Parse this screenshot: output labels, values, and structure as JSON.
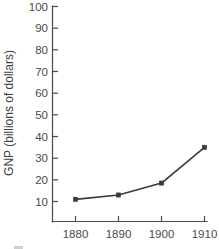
{
  "chart_data": {
    "type": "line",
    "title": "",
    "subtitle": "",
    "xlabel": "",
    "ylabel": "GNP (billions of dollars)",
    "x": [
      1880,
      1890,
      1900,
      1910
    ],
    "categories": [
      "1880",
      "1890",
      "1900",
      "1910"
    ],
    "values": [
      11,
      13,
      18.5,
      35
    ],
    "series": [
      {
        "name": "GNP",
        "values": [
          11,
          13,
          18.5,
          35
        ]
      }
    ],
    "xlim": [
      1875,
      1913
    ],
    "ylim": [
      0,
      100
    ],
    "xtick_labels": [
      "1880",
      "1890",
      "1900",
      "1910"
    ],
    "ytick_labels": [
      "10",
      "20",
      "30",
      "40",
      "50",
      "60",
      "70",
      "80",
      "90",
      "100"
    ],
    "ytick_values": [
      10,
      20,
      30,
      40,
      50,
      60,
      70,
      80,
      90,
      100
    ],
    "grid": false,
    "legend": false,
    "legend_position": "none",
    "marker": "square",
    "line_color": "#3a3a3a",
    "axis_color": "#4a4a4a",
    "text_color": "#4a4a4a",
    "background_color": "#ffffff",
    "annotations": []
  },
  "axis": {
    "y_title": "GNP (billions of dollars)",
    "y_ticks": [
      {
        "label": "100",
        "value": 100
      },
      {
        "label": "90",
        "value": 90
      },
      {
        "label": "80",
        "value": 80
      },
      {
        "label": "70",
        "value": 70
      },
      {
        "label": "60",
        "value": 60
      },
      {
        "label": "50",
        "value": 50
      },
      {
        "label": "40",
        "value": 40
      },
      {
        "label": "30",
        "value": 30
      },
      {
        "label": "20",
        "value": 20
      },
      {
        "label": "10",
        "value": 10
      }
    ],
    "x_ticks": [
      {
        "label": "1880",
        "value": 1880
      },
      {
        "label": "1890",
        "value": 1890
      },
      {
        "label": "1900",
        "value": 1900
      },
      {
        "label": "1910",
        "value": 1910
      }
    ]
  },
  "points": [
    {
      "x_label": "1880",
      "y_label": "11"
    },
    {
      "x_label": "1890",
      "y_label": "13"
    },
    {
      "x_label": "1900",
      "y_label": "18.5"
    },
    {
      "x_label": "1910",
      "y_label": "35"
    }
  ]
}
